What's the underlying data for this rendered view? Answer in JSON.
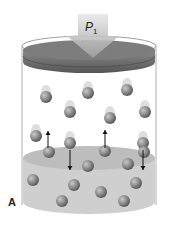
{
  "figure": {
    "panel_label": "A",
    "pressure_label": "P",
    "pressure_subscript": "1"
  },
  "colors": {
    "piston_top": "#7a7a7a",
    "piston_side": "#5e5e5e",
    "arrow": "#b8b8b8",
    "liquid": "#c8c8c8",
    "molecule": "#8a8a8a",
    "cylinder_outline": "#9a9a9a"
  },
  "molecules_gas": [
    {
      "x": 46,
      "y": 97
    },
    {
      "x": 88,
      "y": 93
    },
    {
      "x": 127,
      "y": 90
    },
    {
      "x": 70,
      "y": 112
    },
    {
      "x": 110,
      "y": 118
    },
    {
      "x": 145,
      "y": 112
    },
    {
      "x": 36,
      "y": 136
    },
    {
      "x": 70,
      "y": 143
    },
    {
      "x": 143,
      "y": 143
    }
  ],
  "molecules_liquid": [
    {
      "x": 49,
      "y": 152
    },
    {
      "x": 105,
      "y": 151
    },
    {
      "x": 144,
      "y": 152
    },
    {
      "x": 88,
      "y": 166
    },
    {
      "x": 128,
      "y": 164
    },
    {
      "x": 33,
      "y": 180
    },
    {
      "x": 74,
      "y": 185
    },
    {
      "x": 101,
      "y": 192
    },
    {
      "x": 136,
      "y": 183
    },
    {
      "x": 62,
      "y": 201
    },
    {
      "x": 124,
      "y": 201
    }
  ],
  "motion_arrows": [
    {
      "direction": "up",
      "x": 48,
      "y1": 148,
      "y2": 131
    },
    {
      "direction": "down",
      "x": 70,
      "y1": 150,
      "y2": 170
    },
    {
      "direction": "up",
      "x": 105,
      "y1": 148,
      "y2": 130
    },
    {
      "direction": "down",
      "x": 143,
      "y1": 150,
      "y2": 170
    }
  ]
}
